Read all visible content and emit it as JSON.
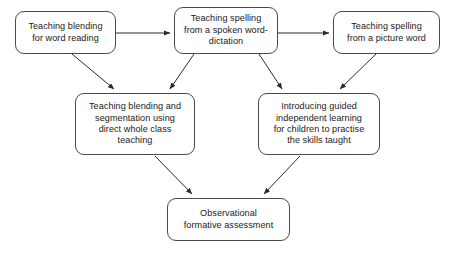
{
  "diagram": {
    "background_color": "#ffffff",
    "box_border_color": "#4a4a4a",
    "arrow_color": "#2b2b2b",
    "text_color": "#1a1a1a",
    "nodes": [
      {
        "id": "blending-word-reading",
        "label": "Teaching blending\nfor word reading",
        "lines": [
          "Teaching blending",
          "for word reading"
        ]
      },
      {
        "id": "spelling-dictation",
        "label": "Teaching spelling\nfrom a spoken word-\ndictation",
        "lines": [
          "Teaching spelling",
          "from a spoken word-",
          "dictation"
        ]
      },
      {
        "id": "spelling-picture",
        "label": "Teaching spelling\nfrom a picture word",
        "lines": [
          "Teaching spelling",
          "from a picture word"
        ]
      },
      {
        "id": "blending-segmentation",
        "label": "Teaching blending and\nsegmentation using\ndirect whole class\nteaching",
        "lines": [
          "Teaching blending and",
          "segmentation using",
          "direct whole class",
          "teaching"
        ]
      },
      {
        "id": "guided-learning",
        "label": "Introducing guided\nindependent learning\nfor children to practise\nthe skills taught",
        "lines": [
          "Introducing guided",
          "independent learning",
          "for children to practise",
          "the skills taught"
        ]
      },
      {
        "id": "observational",
        "label": "Observational\nformative assessment",
        "lines": [
          "Observational",
          "formative assessment"
        ]
      }
    ],
    "connectors": [
      {
        "id": "blending-word-reading-to-spelling-dictation",
        "from": "blending-word-reading",
        "to": "spelling-dictation",
        "style": "arrow"
      },
      {
        "id": "spelling-dictation-to-spelling-picture",
        "from": "spelling-dictation",
        "to": "spelling-picture",
        "style": "arrow"
      },
      {
        "id": "blending-word-reading-to-blending-segmentation",
        "from": "blending-word-reading",
        "to": "blending-segmentation",
        "style": "arrow"
      },
      {
        "id": "spelling-dictation-to-blending-segmentation",
        "from": "spelling-dictation",
        "to": "blending-segmentation",
        "style": "arrow"
      },
      {
        "id": "spelling-dictation-to-guided-learning",
        "from": "spelling-dictation",
        "to": "guided-learning",
        "style": "arrow"
      },
      {
        "id": "spelling-picture-to-guided-learning",
        "from": "spelling-picture",
        "to": "guided-learning",
        "style": "arrow"
      },
      {
        "id": "blending-segmentation-to-observational",
        "from": "blending-segmentation",
        "to": "observational",
        "style": "arrow"
      },
      {
        "id": "guided-learning-to-observational",
        "from": "guided-learning",
        "to": "observational",
        "style": "arrow"
      }
    ]
  }
}
